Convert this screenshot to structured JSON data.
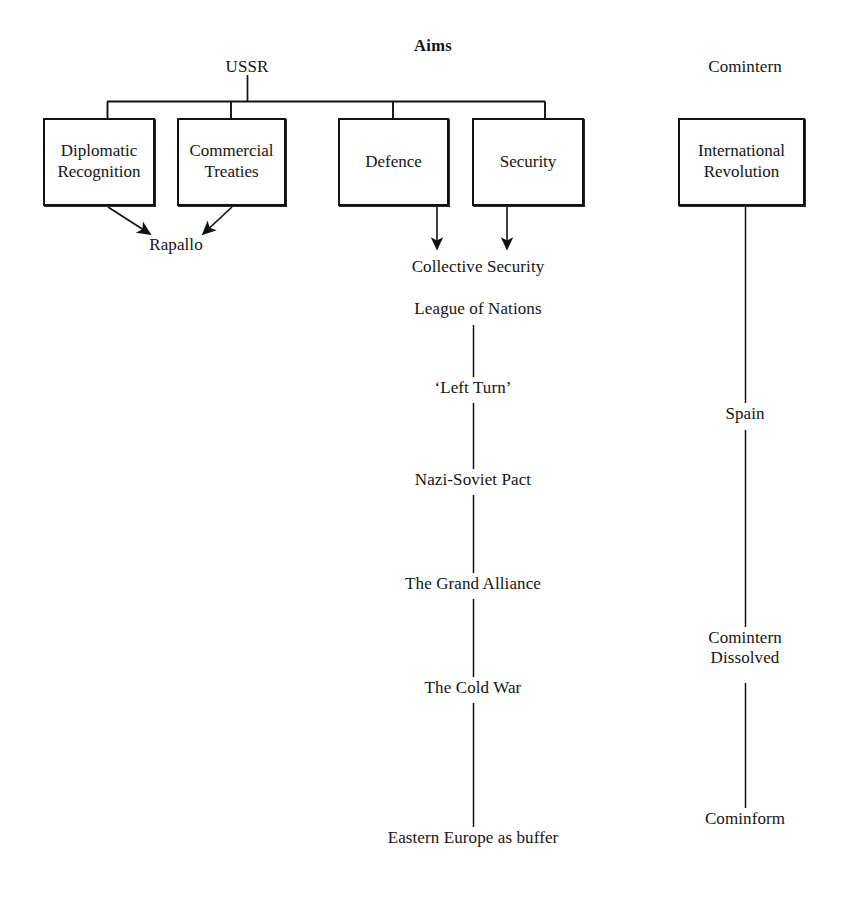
{
  "diagram": {
    "title": "Aims",
    "headings": {
      "ussr": "USSR",
      "comintern": "Comintern"
    },
    "aims_boxes": [
      {
        "id": "diplomatic-recognition",
        "label": "Diplomatic\nRecognition"
      },
      {
        "id": "commercial-treaties",
        "label": "Commercial\nTreaties"
      },
      {
        "id": "defence",
        "label": "Defence"
      },
      {
        "id": "security",
        "label": "Security"
      }
    ],
    "outcomes": {
      "rapallo": "Rapallo",
      "collective_security": "Collective Security"
    },
    "timeline": [
      {
        "id": "league-of-nations",
        "label": "League of Nations"
      },
      {
        "id": "left-turn",
        "label": "‘Left Turn’"
      },
      {
        "id": "nazi-soviet-pact",
        "label": "Nazi-Soviet Pact"
      },
      {
        "id": "grand-alliance",
        "label": "The Grand Alliance"
      },
      {
        "id": "cold-war",
        "label": "The Cold War"
      },
      {
        "id": "eastern-europe-buffer",
        "label": "Eastern Europe as buffer"
      }
    ],
    "comintern_box": {
      "id": "international-revolution",
      "label": "International\nRevolution"
    },
    "comintern_timeline": [
      {
        "id": "spain",
        "label": "Spain"
      },
      {
        "id": "comintern-dissolved",
        "label": "Comintern\nDissolved"
      },
      {
        "id": "cominform",
        "label": "Cominform"
      }
    ],
    "colors": {
      "ink": "#141414",
      "line": "#111111",
      "paper": "#ffffff"
    }
  }
}
